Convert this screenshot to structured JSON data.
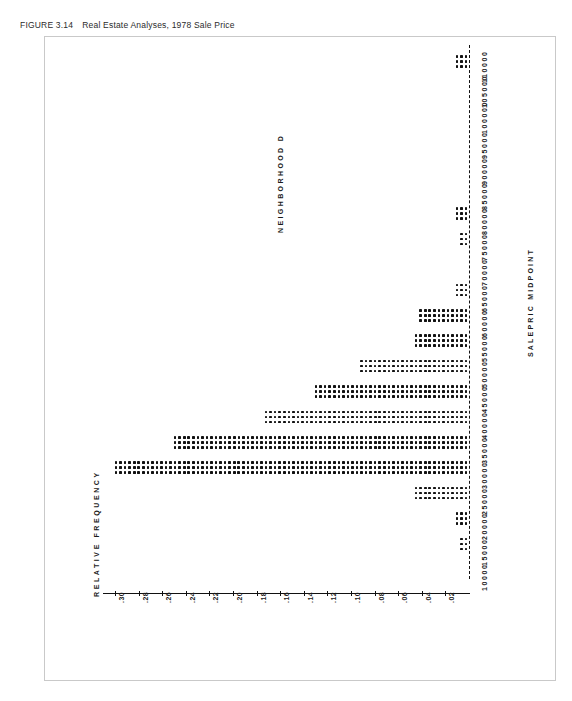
{
  "caption": {
    "figure_label": "FIGURE 3.14",
    "title": "Real Estate Analyses, 1978 Sale Price"
  },
  "chart_data": {
    "type": "bar",
    "orientation": "horizontal",
    "title": "NEIGHBORHOOD  D",
    "xlabel": "SALEPRIC MIDPOINT",
    "ylabel": "RELATIVE FREQUENCY",
    "grid": false,
    "legend": null,
    "axis_style": "dashed-baseline",
    "value_axis_ticks": [
      ".30",
      ".28",
      ".26",
      ".24",
      ".22",
      ".20",
      ".18",
      ".16",
      ".14",
      ".12",
      ".10",
      ".08",
      ".06",
      ".04",
      ".02"
    ],
    "value_axis_range": [
      0,
      0.31
    ],
    "categories": [
      "110000",
      "105000",
      "100000",
      "95000",
      "90000",
      "85000",
      "80000",
      "75000",
      "70000",
      "65000",
      "60000",
      "55000",
      "50000",
      "45000",
      "40000",
      "35000",
      "30000",
      "25000",
      "20000",
      "15000",
      "10000"
    ],
    "values": [
      0.012,
      0.0,
      0.0,
      0.0,
      0.0,
      0.0,
      0.012,
      0.008,
      0.0,
      0.012,
      0.044,
      0.046,
      0.092,
      0.132,
      0.172,
      0.252,
      0.302,
      0.046,
      0.01,
      0.006,
      0.0
    ],
    "marker": "dot-matrix",
    "bar_rows": 3
  }
}
